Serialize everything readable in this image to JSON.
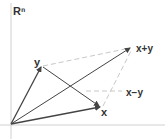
{
  "diagram": {
    "space_label": "Rⁿ",
    "vectors": [
      {
        "name": "x",
        "label": "x"
      },
      {
        "name": "y",
        "label": "y"
      },
      {
        "name": "x_plus_y",
        "label": "x+y"
      },
      {
        "name": "x_minus_y",
        "label": "x−y"
      }
    ],
    "colors": {
      "axis": "#d0d0d0",
      "vector": "#444444",
      "dashed": "#c8c8c8",
      "text": "#333333"
    }
  }
}
